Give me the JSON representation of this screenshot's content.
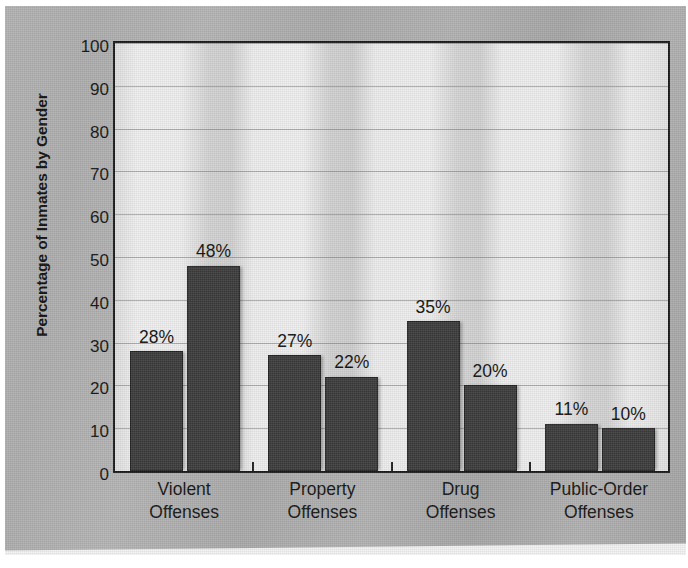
{
  "chart_data": {
    "type": "bar",
    "title": "",
    "xlabel": "",
    "ylabel": "Percentage of Inmates by Gender",
    "ylim": [
      0,
      100
    ],
    "ytick_step": 10,
    "ytick_labels": [
      "100",
      "90",
      "80",
      "70",
      "60",
      "50",
      "40",
      "30",
      "20",
      "10",
      "0"
    ],
    "grid": "horizontal",
    "legend_position": "inside-top-center",
    "categories": [
      "Violent Offenses",
      "Property Offenses",
      "Drug Offenses",
      "Public-Order Offenses"
    ],
    "category_lines": [
      [
        "Violent",
        "Offenses"
      ],
      [
        "Property",
        "Offenses"
      ],
      [
        "Drug",
        "Offenses"
      ],
      [
        "Public-Order",
        "Offenses"
      ]
    ],
    "series": [
      {
        "name": "Female",
        "color": "#3b3b3b",
        "values": [
          28,
          27,
          35,
          11
        ],
        "data_labels": [
          "28%",
          "27%",
          "35%",
          "11%"
        ]
      },
      {
        "name": "Male",
        "color": "#3b3b3b",
        "values": [
          48,
          22,
          20,
          10
        ],
        "data_labels": [
          "48%",
          "22%",
          "20%",
          "10%"
        ]
      }
    ],
    "colors": {
      "bar": "#3b3b3b",
      "bar_border": "#232323",
      "plot_background": "#e9e9e9",
      "page_background": "#adadad",
      "axis": "#1a1a1a",
      "gridline": "#787878",
      "text": "#111111"
    }
  },
  "legend": {
    "items": [
      {
        "label": "Female"
      },
      {
        "label": "Male"
      }
    ]
  }
}
